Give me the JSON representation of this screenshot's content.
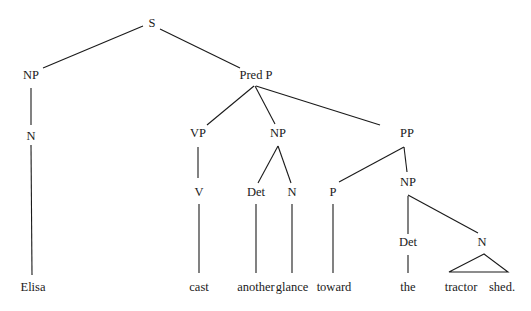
{
  "diagram": {
    "type": "syntax-tree",
    "sentence": "Elisa cast another glance toward the tractor shed.",
    "nodes": [
      {
        "id": "S",
        "label": "S",
        "x": 152,
        "y": 27
      },
      {
        "id": "NP1",
        "label": "NP",
        "x": 31,
        "y": 79
      },
      {
        "id": "PredP",
        "label": "Pred P",
        "x": 256,
        "y": 79
      },
      {
        "id": "N1",
        "label": "N",
        "x": 31,
        "y": 140
      },
      {
        "id": "VP",
        "label": "VP",
        "x": 198,
        "y": 137
      },
      {
        "id": "NP2",
        "label": "NP",
        "x": 278,
        "y": 137
      },
      {
        "id": "PP",
        "label": "PP",
        "x": 407,
        "y": 137
      },
      {
        "id": "V",
        "label": "V",
        "x": 199,
        "y": 196
      },
      {
        "id": "Det1",
        "label": "Det",
        "x": 256,
        "y": 196
      },
      {
        "id": "N2",
        "label": "N",
        "x": 292,
        "y": 196
      },
      {
        "id": "P",
        "label": "P",
        "x": 333,
        "y": 196
      },
      {
        "id": "NP3",
        "label": "NP",
        "x": 408,
        "y": 186
      },
      {
        "id": "Det2",
        "label": "Det",
        "x": 408,
        "y": 246
      },
      {
        "id": "N3",
        "label": "N",
        "x": 482,
        "y": 246
      }
    ],
    "words": [
      {
        "id": "w1",
        "text": "Elisa",
        "x": 33,
        "y": 291
      },
      {
        "id": "w2",
        "text": "cast",
        "x": 199,
        "y": 291
      },
      {
        "id": "w3",
        "text": "another",
        "x": 256,
        "y": 291
      },
      {
        "id": "w4",
        "text": "glance",
        "x": 292,
        "y": 291
      },
      {
        "id": "w5",
        "text": "toward",
        "x": 334,
        "y": 291
      },
      {
        "id": "w6",
        "text": "the",
        "x": 408,
        "y": 291
      },
      {
        "id": "w7",
        "text": "tractor",
        "x": 461,
        "y": 291
      },
      {
        "id": "w8",
        "text": "shed.",
        "x": 502,
        "y": 291
      }
    ],
    "edges": [
      {
        "x1": 143,
        "y1": 26,
        "x2": 43,
        "y2": 68
      },
      {
        "x1": 160,
        "y1": 29,
        "x2": 240,
        "y2": 68
      },
      {
        "x1": 31,
        "y1": 88,
        "x2": 31,
        "y2": 125
      },
      {
        "x1": 31,
        "y1": 145,
        "x2": 32,
        "y2": 275
      },
      {
        "x1": 254,
        "y1": 86,
        "x2": 207,
        "y2": 125
      },
      {
        "x1": 255,
        "y1": 86,
        "x2": 275,
        "y2": 124
      },
      {
        "x1": 256,
        "y1": 86,
        "x2": 380,
        "y2": 125
      },
      {
        "x1": 198,
        "y1": 147,
        "x2": 198,
        "y2": 178
      },
      {
        "x1": 278,
        "y1": 146,
        "x2": 258,
        "y2": 183
      },
      {
        "x1": 278,
        "y1": 146,
        "x2": 291,
        "y2": 183
      },
      {
        "x1": 404,
        "y1": 147,
        "x2": 339,
        "y2": 182
      },
      {
        "x1": 404,
        "y1": 147,
        "x2": 407,
        "y2": 172
      },
      {
        "x1": 199,
        "y1": 204,
        "x2": 199,
        "y2": 273
      },
      {
        "x1": 256,
        "y1": 204,
        "x2": 256,
        "y2": 273
      },
      {
        "x1": 292,
        "y1": 204,
        "x2": 292,
        "y2": 273
      },
      {
        "x1": 333,
        "y1": 204,
        "x2": 333,
        "y2": 273
      },
      {
        "x1": 408,
        "y1": 196,
        "x2": 408,
        "y2": 234
      },
      {
        "x1": 408,
        "y1": 195,
        "x2": 478,
        "y2": 233
      },
      {
        "x1": 408,
        "y1": 255,
        "x2": 408,
        "y2": 273
      }
    ],
    "triangle": {
      "apex_x": 484,
      "apex_y": 254,
      "left_x": 449,
      "right_x": 508,
      "base_y": 272
    }
  }
}
